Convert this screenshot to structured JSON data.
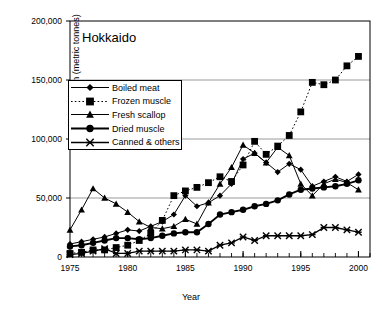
{
  "chart_data": {
    "type": "line",
    "title": "Hokkaido",
    "xlabel": "Year",
    "ylabel": "Production (metric tonnes)",
    "xlim": [
      1975,
      2001
    ],
    "ylim": [
      0,
      200000
    ],
    "yticks": [
      0,
      50000,
      100000,
      150000,
      200000
    ],
    "ytick_labels": [
      "0",
      "50,000",
      "100,000",
      "150,000",
      "200,000"
    ],
    "xticks": [
      1975,
      1980,
      1985,
      1990,
      1995,
      2000
    ],
    "xtick_labels": [
      "1975",
      "1980",
      "1985",
      "1990",
      "1995",
      "2000"
    ],
    "x_minor_tick_step": 1,
    "grid": "horizontal",
    "legend_position": "upper-left",
    "x": [
      1975,
      1976,
      1977,
      1978,
      1979,
      1980,
      1981,
      1982,
      1983,
      1984,
      1985,
      1986,
      1987,
      1988,
      1989,
      1990,
      1991,
      1992,
      1993,
      1994,
      1995,
      1996,
      1997,
      1998,
      1999,
      2000
    ],
    "series": [
      {
        "name": "Boiled meat",
        "marker": "diamond",
        "line": "solid",
        "values": [
          11000,
          13000,
          15000,
          17000,
          20000,
          23000,
          22000,
          26000,
          30000,
          36000,
          52000,
          43000,
          46000,
          52000,
          62000,
          83000,
          88000,
          80000,
          72000,
          79000,
          74000,
          60000,
          64000,
          68000,
          64000,
          70000
        ]
      },
      {
        "name": "Frozen muscle",
        "marker": "square",
        "line": "dotted",
        "values": [
          3000,
          4000,
          6000,
          6000,
          8000,
          10000,
          14000,
          20000,
          31000,
          52000,
          56000,
          59000,
          63000,
          68000,
          64000,
          78000,
          98000,
          87000,
          94000,
          103000,
          123000,
          148000,
          146000,
          150000,
          162000,
          170000
        ]
      },
      {
        "name": "Fresh scallop",
        "marker": "triangle",
        "line": "solid",
        "values": [
          23000,
          40000,
          58000,
          50000,
          45000,
          38000,
          30000,
          25000,
          24000,
          26000,
          32000,
          28000,
          46000,
          62000,
          76000,
          95000,
          88000,
          80000,
          93000,
          86000,
          62000,
          52000,
          62000,
          66000,
          63000,
          57000
        ]
      },
      {
        "name": "Dried muscle",
        "marker": "circle",
        "line": "solid",
        "values": [
          9000,
          10000,
          12000,
          14000,
          16000,
          16000,
          15000,
          16000,
          18000,
          20000,
          21000,
          21000,
          28000,
          36000,
          38000,
          40000,
          43000,
          45000,
          48000,
          53000,
          57000,
          58000,
          59000,
          60000,
          62000,
          65000
        ]
      },
      {
        "name": "Canned & others",
        "marker": "cross",
        "line": "solid",
        "values": [
          2000,
          3000,
          5000,
          7000,
          3000,
          3000,
          5000,
          5000,
          5000,
          5000,
          6000,
          6000,
          5000,
          10000,
          12000,
          17000,
          14000,
          18000,
          18000,
          18000,
          18000,
          19000,
          25000,
          25000,
          23000,
          21000
        ]
      }
    ]
  },
  "colors": {
    "axis": "#000000",
    "grid": "#808080",
    "series": "#000000",
    "background": "#ffffff"
  }
}
